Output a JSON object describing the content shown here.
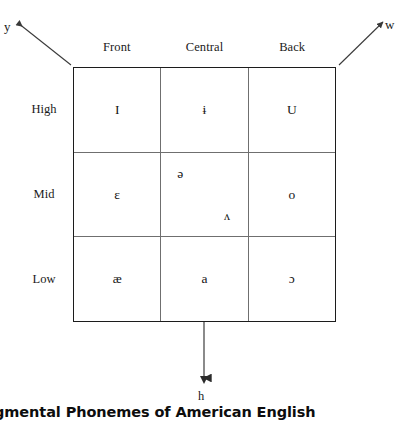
{
  "figure": {
    "caption": "Segmental Phonemes of American English"
  },
  "glides": {
    "front_glide": {
      "label": "y",
      "icon": "arrow-up-left-icon"
    },
    "back_glide": {
      "label": "w",
      "icon": "arrow-up-right-icon"
    },
    "down_glide": {
      "label": "h",
      "icon": "arrow-down-icon"
    }
  },
  "grid": {
    "columns": [
      "Front",
      "Central",
      "Back"
    ],
    "rows": [
      "High",
      "Mid",
      "Low"
    ],
    "cells": [
      [
        {
          "symbols": [
            {
              "glyph": "I",
              "position": "center"
            }
          ]
        },
        {
          "symbols": [
            {
              "glyph": "ɨ",
              "position": "center"
            }
          ]
        },
        {
          "symbols": [
            {
              "glyph": "U",
              "position": "center"
            }
          ]
        }
      ],
      [
        {
          "symbols": [
            {
              "glyph": "ɛ",
              "position": "center"
            }
          ]
        },
        {
          "symbols": [
            {
              "glyph": "ə",
              "position": "upper-left"
            },
            {
              "glyph": "ʌ",
              "position": "lower-right"
            }
          ]
        },
        {
          "symbols": [
            {
              "glyph": "o",
              "position": "center"
            }
          ]
        }
      ],
      [
        {
          "symbols": [
            {
              "glyph": "æ",
              "position": "center"
            }
          ]
        },
        {
          "symbols": [
            {
              "glyph": "a",
              "position": "center"
            }
          ]
        },
        {
          "symbols": [
            {
              "glyph": "ɔ",
              "position": "center"
            }
          ]
        }
      ]
    ]
  },
  "colors": {
    "background": "#ffffff",
    "outer_border": "#1c1c1c",
    "inner_rule": "#6f6f6f",
    "text": "#141414",
    "caption_text": "#0d0d0d"
  }
}
